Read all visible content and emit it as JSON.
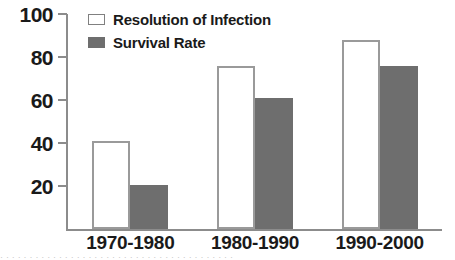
{
  "chart_data": {
    "type": "bar",
    "title": "",
    "subtitle": "",
    "xlabel": "",
    "ylabel": "",
    "categories": [
      "1970-1980",
      "1980-1990",
      "1990-2000"
    ],
    "series": [
      {
        "name": "Resolution of Infection",
        "values": [
          41,
          76,
          88
        ],
        "color": "#ffffff",
        "edge_color": "#9a9a9a"
      },
      {
        "name": "Survival Rate",
        "values": [
          20.5,
          61,
          76
        ],
        "color": "#6e6e6e",
        "edge_color": "#6e6e6e"
      }
    ],
    "ylim": [
      0,
      100
    ],
    "yticks": [
      20,
      40,
      60,
      80,
      100
    ],
    "ytick_labels": [
      "20",
      "40",
      "60",
      "80",
      "100"
    ],
    "grid": false,
    "legend_position": "upper-left",
    "annotations": []
  },
  "legend": {
    "entries": [
      {
        "label": "Resolution of Infection",
        "swatch": "open-square-swatch"
      },
      {
        "label": "Survival Rate",
        "swatch": "filled-square-swatch"
      }
    ]
  },
  "axes": {
    "y_tick_labels": [
      "100",
      "80",
      "60",
      "40",
      "20"
    ],
    "x_group_labels": [
      "1970-1980",
      "1980-1990",
      "1990-2000"
    ]
  },
  "caption": {
    "clipped_text": "· · · · · · · · · · · · · · · · · · · · · · · · · · · · · · · · · · · · · · · ·"
  },
  "colors": {
    "bar_fill_survival": "#6e6e6e",
    "bar_edge_resolution": "#9a9a9a",
    "axis": "#8c8c8c",
    "text": "#1a1a1a",
    "background": "#ffffff"
  }
}
